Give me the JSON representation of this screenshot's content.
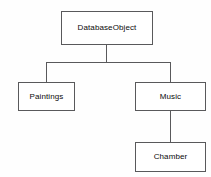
{
  "diagram": {
    "type": "tree-hierarchy",
    "background_color": "#fefefe",
    "line_color": "#59595b",
    "text_color": "#0a0a0a",
    "nodes": [
      {
        "id": "root",
        "label": "DatabaseObject"
      },
      {
        "id": "left",
        "label": "Paintings"
      },
      {
        "id": "right",
        "label": "Music"
      },
      {
        "id": "grandchild",
        "label": "Chamber"
      }
    ],
    "edges": [
      {
        "from": "root",
        "to": "left"
      },
      {
        "from": "root",
        "to": "right"
      },
      {
        "from": "right",
        "to": "grandchild"
      }
    ]
  }
}
